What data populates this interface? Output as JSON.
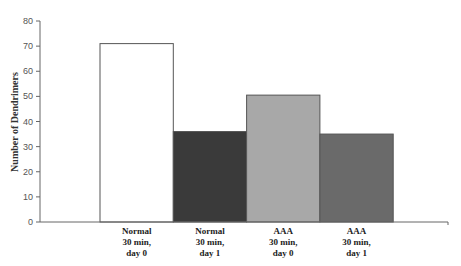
{
  "chart_data": {
    "type": "bar",
    "title": "",
    "xlabel": "",
    "ylabel": "Number of Dendrimers",
    "ylim": [
      0,
      80
    ],
    "yticks": [
      0,
      10,
      20,
      30,
      40,
      50,
      60,
      70,
      80
    ],
    "grid": false,
    "legend": null,
    "categories": [
      [
        "Normal",
        "30 min,",
        "day 0"
      ],
      [
        "Normal",
        "30 min,",
        "day 1"
      ],
      [
        "AAA",
        "30 min,",
        "day 0"
      ],
      [
        "AAA",
        "30 min,",
        "day 1"
      ]
    ],
    "values": [
      71,
      36,
      50.5,
      35
    ],
    "colors": [
      "#ffffff",
      "#3a3a3a",
      "#a8a8a8",
      "#6a6a6a"
    ]
  }
}
